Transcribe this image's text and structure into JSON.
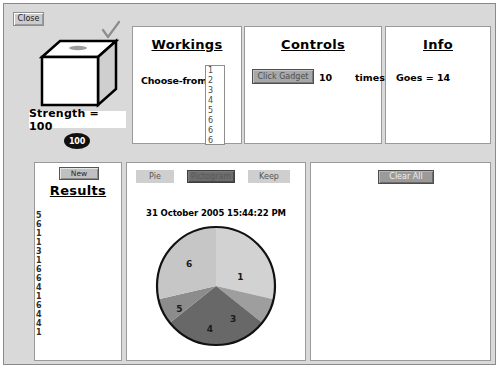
{
  "window": {
    "close_label": "Close",
    "tick_icon": "check-mark"
  },
  "gadget": {
    "icon": "cube-icon",
    "strength_label": "Strength = 100",
    "badge_value": "100"
  },
  "workings": {
    "title": "Workings",
    "choose_from_label": "Choose-from",
    "options": [
      "1",
      "2",
      "3",
      "4",
      "5",
      "6",
      "6",
      "6"
    ]
  },
  "controls": {
    "title": "Controls",
    "click_gadget_label": "Click Gadget",
    "times_value": "10",
    "times_label": "times"
  },
  "info": {
    "title": "Info",
    "goes_text": "Goes = 14"
  },
  "results": {
    "new_label": "New",
    "title": "Results",
    "values": [
      "5",
      "6",
      "1",
      "1",
      "3",
      "1",
      "6",
      "6",
      "4",
      "1",
      "6",
      "4",
      "4",
      "1"
    ]
  },
  "chart_toolbar": {
    "pie_label": "Pie",
    "pictogram_label": "Pictogram",
    "keep_label": "Keep"
  },
  "right_panel": {
    "clear_all_label": "Clear All"
  },
  "chart_data": {
    "type": "pie",
    "title": "31 October 2005 15:44:22 PM",
    "categories": [
      "1",
      "3",
      "4",
      "5",
      "6"
    ],
    "labels": [
      "1",
      "3",
      "4",
      "5",
      "6"
    ],
    "values": [
      4,
      1,
      4,
      1,
      4
    ],
    "counts": {
      "1": 4,
      "3": 1,
      "4": 4,
      "5": 1,
      "6": 4
    },
    "total": 14,
    "colors": [
      "#d2d2d2",
      "#a0a0a0",
      "#6f6f6f",
      "#8a8a8a",
      "#c4c4c4"
    ],
    "legend": "none",
    "grid": false,
    "start_angle_deg": 0,
    "slices": [
      {
        "label": "1",
        "value": 4,
        "start_deg": 0,
        "end_deg": 102.9,
        "color": "#d2d2d2",
        "label_x": 0.7,
        "label_y": 0.43
      },
      {
        "label": "3",
        "value": 1,
        "start_deg": 102.9,
        "end_deg": 128.6,
        "color": "#9e9e9e",
        "label_x": 0.64,
        "label_y": 0.77
      },
      {
        "label": "4",
        "value": 4,
        "start_deg": 128.6,
        "end_deg": 231.4,
        "color": "#686868",
        "label_x": 0.45,
        "label_y": 0.85
      },
      {
        "label": "5",
        "value": 1,
        "start_deg": 231.4,
        "end_deg": 257.1,
        "color": "#8c8c8c",
        "label_x": 0.2,
        "label_y": 0.69
      },
      {
        "label": "6",
        "value": 4,
        "start_deg": 257.1,
        "end_deg": 360,
        "color": "#c6c6c6",
        "label_x": 0.28,
        "label_y": 0.32
      }
    ]
  }
}
